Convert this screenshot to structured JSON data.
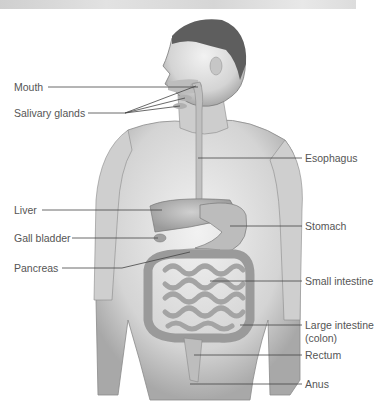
{
  "diagram": {
    "labels_left": [
      {
        "id": "mouth",
        "text": "Mouth",
        "y": 87
      },
      {
        "id": "salivary-glands",
        "text": "Salivary glands",
        "y": 113
      },
      {
        "id": "liver",
        "text": "Liver",
        "y": 210
      },
      {
        "id": "gall-bladder",
        "text": "Gall bladder",
        "y": 238
      },
      {
        "id": "pancreas",
        "text": "Pancreas",
        "y": 268
      }
    ],
    "labels_right": [
      {
        "id": "esophagus",
        "text": "Esophagus",
        "y": 158
      },
      {
        "id": "stomach",
        "text": "Stomach",
        "y": 226
      },
      {
        "id": "small-intestine",
        "text": "Small intestine",
        "y": 281
      },
      {
        "id": "large-intestine",
        "text": "Large intestine",
        "y": 325
      },
      {
        "id": "large-intestine-sub",
        "text": "(colon)",
        "y": 338
      },
      {
        "id": "rectum",
        "text": "Rectum",
        "y": 355
      },
      {
        "id": "anus",
        "text": "Anus",
        "y": 384
      }
    ],
    "colors": {
      "label_text": "#555555",
      "leader_line": "#444444",
      "skin": "#d9d9d9",
      "hair": "#5a5a5a",
      "organ": "#b8b8b8"
    }
  }
}
